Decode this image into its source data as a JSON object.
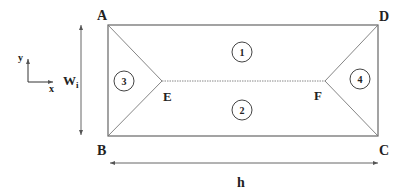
{
  "diagram": {
    "vertices": {
      "A": {
        "label": "A"
      },
      "B": {
        "label": "B"
      },
      "C": {
        "label": "C"
      },
      "D": {
        "label": "D"
      },
      "E": {
        "label": "E"
      },
      "F": {
        "label": "F"
      }
    },
    "regions": [
      {
        "id": "1",
        "label": "1"
      },
      {
        "id": "2",
        "label": "2"
      },
      {
        "id": "3",
        "label": "3"
      },
      {
        "id": "4",
        "label": "4"
      }
    ],
    "axes": {
      "x": "x",
      "y": "y"
    },
    "dimensions": {
      "width": {
        "label": "W",
        "subscript": "i"
      },
      "length": {
        "label": "h"
      }
    },
    "colors": {
      "line": "#555555",
      "text": "#222222"
    }
  }
}
